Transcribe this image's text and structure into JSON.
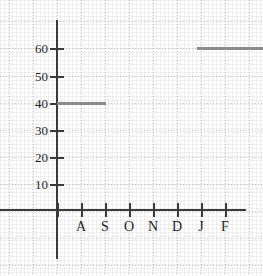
{
  "chart_data": {
    "type": "line",
    "title": "",
    "subtitle": "",
    "xlabel": "",
    "ylabel": "",
    "grid": true,
    "legend": "none",
    "xlim": [
      0,
      8
    ],
    "ylim": [
      0,
      68
    ],
    "x_tick_labels": [
      "A",
      "S",
      "O",
      "N",
      "D",
      "J",
      "F"
    ],
    "y_tick_labels": [
      "10",
      "20",
      "30",
      "40",
      "50",
      "60"
    ],
    "y_tick_values": [
      10,
      20,
      30,
      40,
      50,
      60
    ],
    "series": [
      {
        "name": "step",
        "style": "step-horizontal-segments",
        "color": "#8a8a8a",
        "segments": [
          {
            "label": "first-step",
            "value": 40,
            "x_start_label": "start",
            "x_end_label": "S"
          },
          {
            "label": "second-step",
            "value": 60,
            "x_start_label": "J",
            "x_end_label": "end"
          }
        ]
      }
    ],
    "annotations": []
  },
  "axes": {
    "x_axis_name": "x-axis",
    "y_axis_name": "y-axis",
    "color": "#3a3a3a"
  },
  "geometry": {
    "y_axis_x": 56,
    "x_axis_y": 209,
    "y_ticks_px": [
      184,
      157,
      130,
      103,
      76,
      48
    ],
    "x_ticks_px": [
      57,
      81,
      105,
      129,
      153,
      177,
      201,
      225
    ],
    "x_label_px": [
      81,
      105,
      129,
      153,
      177,
      201,
      225
    ],
    "segment1": {
      "left": 57,
      "right": 106,
      "top": 102
    },
    "segment2": {
      "left": 197,
      "right": 263,
      "top": 47
    },
    "grid_hlines_px": [
      21,
      48,
      76,
      103,
      130,
      157,
      184,
      211,
      238,
      265
    ],
    "grid_vlines_px": [
      9,
      33,
      57,
      81,
      105,
      129,
      153,
      177,
      201,
      225,
      249
    ]
  }
}
